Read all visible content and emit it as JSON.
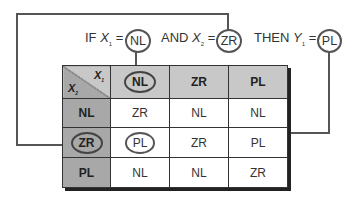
{
  "rule": {
    "if_label": "IF",
    "x1_var": "X",
    "x1_sub": "1",
    "x1_value": "NL",
    "and_label": "AND",
    "x2_var": "X",
    "x2_sub": "2",
    "x2_value": "ZR",
    "then_label": "THEN",
    "y_var": "Y",
    "y_sub": "1",
    "y_value": "PL",
    "eq": "="
  },
  "table": {
    "corner": {
      "col_var": "X",
      "col_sub": "1",
      "row_var": "X",
      "row_sub": "2"
    },
    "columns": [
      "NL",
      "ZR",
      "PL"
    ],
    "rows": [
      {
        "label": "NL",
        "cells": [
          "ZR",
          "NL",
          "NL"
        ]
      },
      {
        "label": "ZR",
        "cells": [
          "PL",
          "ZR",
          "PL"
        ]
      },
      {
        "label": "PL",
        "cells": [
          "NL",
          "NL",
          "ZR"
        ]
      }
    ],
    "highlight": {
      "column": "NL",
      "row": "ZR",
      "output": "PL"
    }
  },
  "colors": {
    "header_fill": "#c8c8c8",
    "row_header_fill": "#a8a8a8",
    "line": "#555555",
    "cell_fill": "#ffffff"
  }
}
